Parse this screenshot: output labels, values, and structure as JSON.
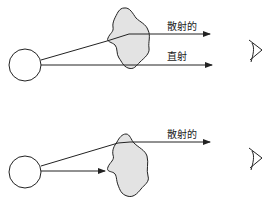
{
  "diagram": {
    "panels": [
      {
        "id": "top",
        "description": "scattered and direct light reaching observer",
        "labels": {
          "scattered": "散射的",
          "direct": "直射"
        }
      },
      {
        "id": "bottom",
        "description": "direct light blocked by obstacle, only scattered light reaches observer",
        "labels": {
          "scattered": "散射的"
        }
      }
    ],
    "colors": {
      "stroke": "#222222",
      "blob_fill": "#e3e3e3",
      "background": "#ffffff"
    },
    "icons": [
      "light-source-circle",
      "particle-blob",
      "eye-icon",
      "arrow-icon"
    ]
  }
}
